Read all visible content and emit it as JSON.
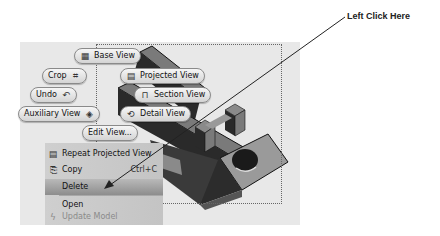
{
  "callout": {
    "text": "Left Click Here"
  },
  "marking_menu": {
    "items": [
      {
        "label": "Base View",
        "icon": "base-view-icon"
      },
      {
        "label": "Crop",
        "icon": "crop-icon"
      },
      {
        "label": "Projected View",
        "icon": "projected-view-icon"
      },
      {
        "label": "Section View",
        "icon": "section-view-icon"
      },
      {
        "label": "Undo",
        "icon": "undo-icon"
      },
      {
        "label": "Detail View",
        "icon": "detail-view-icon"
      },
      {
        "label": "Auxiliary View",
        "icon": "auxiliary-view-icon"
      },
      {
        "label": "Edit View..."
      }
    ]
  },
  "context_menu": {
    "items": [
      {
        "label": "Repeat Projected View",
        "icon": "projected-view-icon",
        "shortcut": "",
        "state": "normal"
      },
      {
        "label": "Copy",
        "icon": "copy-icon",
        "shortcut": "Ctrl+C",
        "state": "normal"
      },
      {
        "label": "Delete",
        "icon": "",
        "shortcut": "",
        "state": "highlighted"
      },
      {
        "label": "Open",
        "icon": "",
        "shortcut": "",
        "state": "normal"
      },
      {
        "label": "Update Model",
        "icon": "update-icon",
        "shortcut": "",
        "state": "disabled"
      }
    ]
  },
  "colors": {
    "canvas": "#e8e8e8",
    "menu_bg": "#c8c8c8",
    "highlight": "#9a9a9a",
    "model_dark": "#2a2a2a",
    "model_mid": "#6e6e6e",
    "model_light": "#9a9a9a"
  }
}
